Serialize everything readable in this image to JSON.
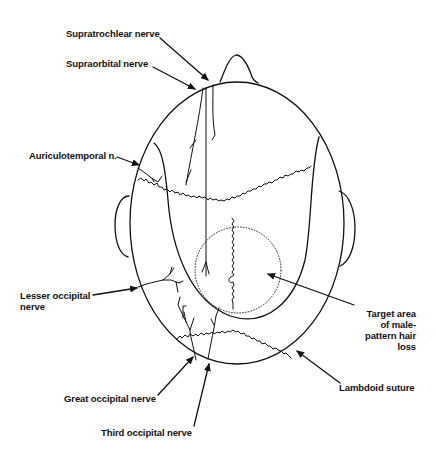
{
  "figure": {
    "type": "anatomical-diagram",
    "labels": {
      "supratrochlear": "Supratrochlear nerve",
      "supraorbital": "Supraorbital nerve",
      "auriculotemporal": "Auriculotemporal n.",
      "lesser_occipital_1": "Lesser occipital",
      "lesser_occipital_2": "nerve",
      "target_1": "Target area",
      "target_2": "of male-",
      "target_3": "pattern hair",
      "target_4": "loss",
      "lambdoid": "Lambdoid suture",
      "great_occipital": "Great occipital nerve",
      "third_occipital": "Third occipital nerve"
    },
    "colors": {
      "line": "#111111",
      "background": "#ffffff"
    }
  }
}
